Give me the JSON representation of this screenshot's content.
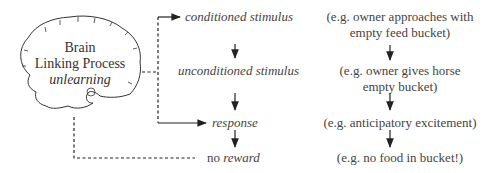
{
  "brain": {
    "title_line1": "Brain",
    "title_line2": "Linking Process",
    "subtitle": "unlearning"
  },
  "chain": {
    "step1": "conditioned stimulus",
    "step2": "unconditioned stimulus",
    "step3": "response",
    "step4_prefix": "no",
    "step4_emph": "reward"
  },
  "examples": {
    "ex1_line1": "(e.g. owner approaches with",
    "ex1_line2": "empty feed bucket)",
    "ex2_line1": "(e.g. owner gives horse",
    "ex2_line2": "empty bucket)",
    "ex3": "(e.g. anticipatory excitement)",
    "ex4": "(e.g. no food in bucket!)"
  },
  "colors": {
    "line": "#222222",
    "text": "#444444"
  }
}
